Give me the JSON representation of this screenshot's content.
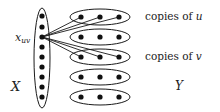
{
  "labels": {
    "vertex": "x",
    "vertex_subscript": "uv",
    "left_set": "X",
    "right_set": "Y",
    "copies_u_prefix": "copies of ",
    "copies_u_var": "u",
    "copies_v_prefix": "copies of ",
    "copies_v_var": "v"
  },
  "left_group": {
    "name": "X",
    "ellipse": {
      "cx": 42,
      "cy": 58,
      "rx": 8,
      "ry": 50
    },
    "dot_x": 42,
    "dot_ys": [
      16,
      27,
      37,
      47,
      57,
      67,
      77,
      87,
      97
    ],
    "highlighted_index": 2
  },
  "right_groups": [
    {
      "id": "copy-u",
      "cy": 17,
      "dot_xs": [
        81,
        100,
        119
      ],
      "connected": true
    },
    {
      "id": "group-2",
      "cy": 37,
      "dot_xs": [
        81,
        100,
        119
      ],
      "connected": false
    },
    {
      "id": "copy-v",
      "cy": 57,
      "dot_xs": [
        81,
        100,
        119
      ],
      "connected": true
    },
    {
      "id": "group-4",
      "cy": 77,
      "dot_xs": [
        81,
        100,
        119
      ],
      "connected": false
    },
    {
      "id": "group-5",
      "cy": 97,
      "dot_xs": [
        81,
        100,
        119
      ],
      "connected": false
    }
  ],
  "right_ellipse": {
    "cx": 100,
    "rx": 30,
    "ry": 8
  },
  "colors": {
    "stroke": "#1a1a1a",
    "dot": "#111111",
    "text": "#222222",
    "background": "#ffffff"
  }
}
